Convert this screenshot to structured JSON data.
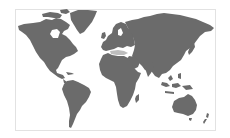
{
  "map": {
    "type": "world-silhouette",
    "colors": {
      "land": "#6b6b6b",
      "background": "#ffffff",
      "frame_border": "#e2e2e2",
      "inland_highlight": "#bdbdbd"
    },
    "regions": [
      "north-america",
      "greenland",
      "south-america",
      "europe",
      "africa",
      "asia",
      "australia",
      "new-zealand"
    ]
  }
}
